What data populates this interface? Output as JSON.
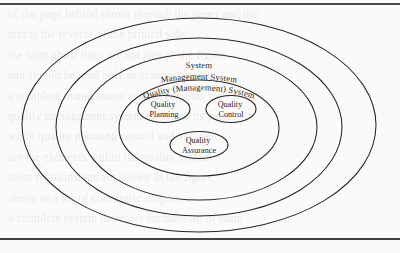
{
  "figure": {
    "type": "concentric-ellipse-venn",
    "background_color": "#fbfaf8",
    "line_color": "#262624",
    "rules": {
      "top_rule_label": "page-rule-top",
      "bottom_rule_label": "page-rule-bottom"
    },
    "rings": [
      {
        "id": "ring-system",
        "label": "System",
        "level": 1,
        "cx": 199,
        "cy": 125,
        "rx": 177,
        "ry": 107,
        "label_layout": "curved-top"
      },
      {
        "id": "ring-management-system",
        "label": "Management System",
        "level": 2,
        "cx": 199,
        "cy": 127,
        "rx": 143,
        "ry": 89,
        "label_layout": "curved-top"
      },
      {
        "id": "ring-quality-management-system",
        "label": "Quality (Management) System",
        "level": 3,
        "cx": 199,
        "cy": 127,
        "rx": 118,
        "ry": 73,
        "label_layout": "curved-top"
      },
      {
        "id": "ring-inner-container",
        "label": "",
        "level": 4,
        "cx": 199,
        "cy": 128,
        "rx": 80,
        "ry": 48,
        "label_layout": "none"
      }
    ],
    "nodes": [
      {
        "id": "node-quality-planning",
        "lines": [
          "Quality",
          "Planning"
        ],
        "cx": 164,
        "cy": 109,
        "rx": 26,
        "ry": 13.5
      },
      {
        "id": "node-quality-control",
        "lines": [
          "Quality",
          "Control"
        ],
        "cx": 231,
        "cy": 109,
        "rx": 25,
        "ry": 13.5
      },
      {
        "id": "node-quality-assurance",
        "lines": [
          "Quality",
          "Assurance"
        ],
        "cx": 199,
        "cy": 145,
        "rx": 29,
        "ry": 13.5
      }
    ]
  },
  "bleed_text": {
    "note": "faint show-through text from the reverse side of the scanned page",
    "lines": [
      "of the page behind shows through the paper and the",
      "text is the reverse of the printed side",
      "the faint ghost lines are not part of the figure",
      "and should be read only as scanner artefact",
      "a complete management system contains the",
      "quality management system as one of its parts",
      "while quality planning control and assurance",
      "are the elements within the quality system",
      "these relationships are shown in the figure",
      "above as a set of concentric ellipses",
      "a complete system therefore includes all of them"
    ]
  }
}
